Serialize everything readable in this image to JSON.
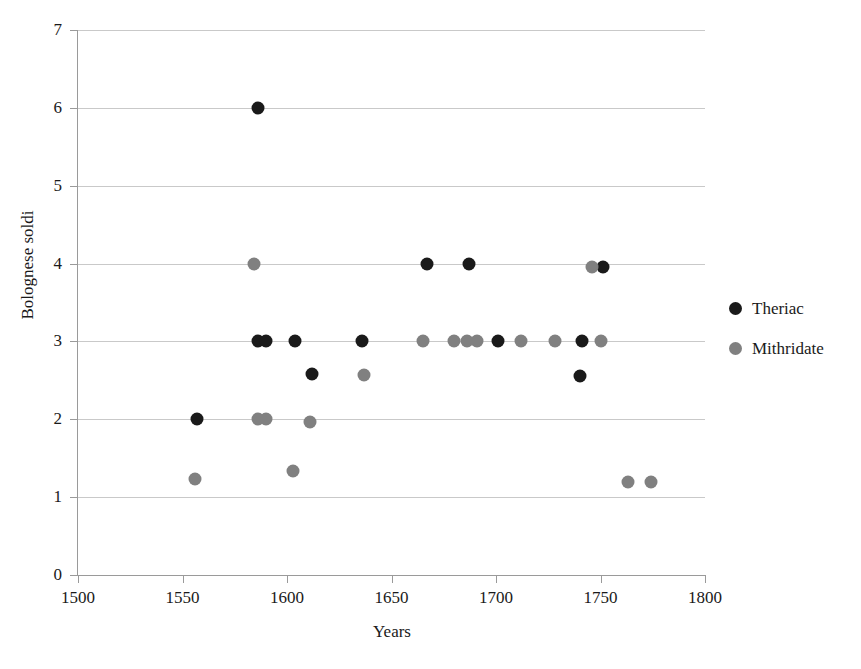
{
  "chart_data": {
    "type": "scatter",
    "title": "",
    "xlabel": "Years",
    "ylabel": "Bolognese soldi",
    "xlim": [
      1500,
      1800
    ],
    "ylim": [
      0,
      7
    ],
    "xticks": [
      1500,
      1550,
      1600,
      1650,
      1700,
      1750,
      1800
    ],
    "yticks": [
      0,
      1,
      2,
      3,
      4,
      5,
      6,
      7
    ],
    "grid": "horizontal",
    "legend_position": "right",
    "colors": {
      "theriac": "#1a1a1a",
      "mithridate": "#808080",
      "gridline": "#c9c9c9",
      "axis": "#9a9a9a",
      "background": "#ffffff"
    },
    "series": [
      {
        "name": "Theriac",
        "color": "#1a1a1a",
        "marker": "circle",
        "points": [
          [
            1586,
            6.0
          ],
          [
            1557,
            2.0
          ],
          [
            1586,
            3.0
          ],
          [
            1590,
            3.0
          ],
          [
            1604,
            3.0
          ],
          [
            1612,
            2.58
          ],
          [
            1636,
            3.0
          ],
          [
            1667,
            4.0
          ],
          [
            1687,
            4.0
          ],
          [
            1701,
            3.0
          ],
          [
            1741,
            3.0
          ],
          [
            1740,
            2.55
          ],
          [
            1751,
            3.95
          ]
        ]
      },
      {
        "name": "Mithridate",
        "color": "#808080",
        "marker": "circle",
        "points": [
          [
            1584,
            4.0
          ],
          [
            1556,
            1.23
          ],
          [
            1586,
            2.0
          ],
          [
            1590,
            2.0
          ],
          [
            1603,
            1.33
          ],
          [
            1611,
            1.97
          ],
          [
            1637,
            2.57
          ],
          [
            1665,
            3.0
          ],
          [
            1680,
            3.0
          ],
          [
            1686,
            3.0
          ],
          [
            1691,
            3.0
          ],
          [
            1712,
            3.0
          ],
          [
            1728,
            3.0
          ],
          [
            1746,
            3.95
          ],
          [
            1750,
            3.0
          ],
          [
            1763,
            1.19
          ],
          [
            1774,
            1.19
          ]
        ]
      }
    ]
  },
  "legend": {
    "items": [
      {
        "label": "Theriac",
        "color": "#1a1a1a"
      },
      {
        "label": "Mithridate",
        "color": "#808080"
      }
    ]
  }
}
